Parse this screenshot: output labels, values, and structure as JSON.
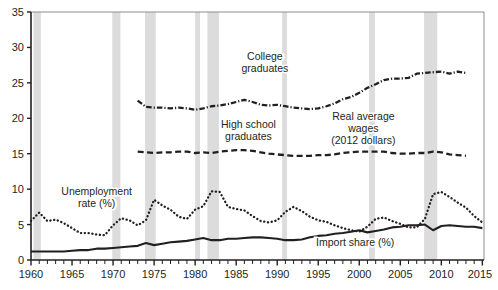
{
  "chart_data": {
    "type": "line",
    "title": "",
    "subtitle": "",
    "xlabel": "",
    "ylabel": "",
    "xlim": [
      1960,
      2015.2
    ],
    "ylim": [
      0,
      35
    ],
    "grid": false,
    "legend_position": "inline-annotations",
    "y_ticks": [
      0,
      5,
      10,
      15,
      20,
      25,
      30,
      35
    ],
    "y_tick_labels": [
      "0",
      "5",
      "10",
      "15",
      "20",
      "25",
      "30",
      "35"
    ],
    "x_ticks": [
      1960,
      1965,
      1970,
      1975,
      1980,
      1985,
      1990,
      1995,
      2000,
      2005,
      2010,
      2015
    ],
    "x_tick_labels": [
      "1960",
      "1965",
      "1970",
      "1975",
      "1980",
      "1985",
      "1990",
      "1995",
      "2000",
      "2005",
      "2010",
      "2015"
    ],
    "x_minor_tick_interval": 1,
    "annotations": [
      {
        "name": "college-graduates-label",
        "text": "College\ngraduates",
        "lines": [
          "College",
          "graduates"
        ],
        "x": 1988.5,
        "y": 28.2
      },
      {
        "name": "high-school-graduates-label",
        "text": "High school\ngraduates",
        "lines": [
          "High school",
          "graduates"
        ],
        "x": 1986.5,
        "y": 18.6
      },
      {
        "name": "real-average-wages-label",
        "text": "Real average\nwages\n(2012 dollars)",
        "lines": [
          "Real average",
          "wages",
          "(2012 dollars)"
        ],
        "x": 2000.5,
        "y": 19.8
      },
      {
        "name": "unemployment-rate-label",
        "text": "Unemployment\nrate (%)",
        "lines": [
          "Unemployment",
          "rate (%)"
        ],
        "x": 1968.0,
        "y": 9.2
      },
      {
        "name": "import-share-label",
        "text": "Import share (%)",
        "lines": [
          "Import share (%)"
        ],
        "x": 1999.5,
        "y": 2.0
      }
    ],
    "recession_bands": [
      {
        "start": 1960.3,
        "end": 1961.2
      },
      {
        "start": 1969.9,
        "end": 1970.9
      },
      {
        "start": 1973.9,
        "end": 1975.2
      },
      {
        "start": 1980.0,
        "end": 1980.6
      },
      {
        "start": 1981.5,
        "end": 1982.9
      },
      {
        "start": 1990.6,
        "end": 1991.2
      },
      {
        "start": 2001.2,
        "end": 2001.9
      },
      {
        "start": 2007.9,
        "end": 2009.5
      }
    ],
    "recession_band_color": "#dcdcdc",
    "series": [
      {
        "name": "College graduates",
        "style": "dash-dot",
        "color": "#231f20",
        "x": [
          1973,
          1974,
          1975,
          1976,
          1977,
          1978,
          1979,
          1980,
          1981,
          1982,
          1983,
          1984,
          1985,
          1986,
          1987,
          1988,
          1989,
          1990,
          1991,
          1992,
          1993,
          1994,
          1995,
          1996,
          1997,
          1998,
          1999,
          2000,
          2001,
          2002,
          2003,
          2004,
          2005,
          2006,
          2007,
          2008,
          2009,
          2010,
          2011,
          2012,
          2013
        ],
        "values": [
          22.5,
          21.6,
          21.5,
          21.5,
          21.4,
          21.5,
          21.4,
          21.2,
          21.4,
          21.7,
          21.8,
          22.0,
          22.3,
          22.6,
          22.3,
          21.9,
          21.8,
          21.9,
          21.7,
          21.5,
          21.4,
          21.3,
          21.4,
          21.7,
          22.1,
          22.7,
          23.0,
          23.6,
          24.3,
          24.8,
          25.4,
          25.6,
          25.6,
          25.7,
          26.3,
          26.4,
          26.5,
          26.6,
          26.3,
          26.6,
          26.4
        ]
      },
      {
        "name": "High school graduates",
        "style": "dashed",
        "color": "#231f20",
        "x": [
          1973,
          1974,
          1975,
          1976,
          1977,
          1978,
          1979,
          1980,
          1981,
          1982,
          1983,
          1984,
          1985,
          1986,
          1987,
          1988,
          1989,
          1990,
          1991,
          1992,
          1993,
          1994,
          1995,
          1996,
          1997,
          1998,
          1999,
          2000,
          2001,
          2002,
          2003,
          2004,
          2005,
          2006,
          2007,
          2008,
          2009,
          2010,
          2011,
          2012,
          2013
        ],
        "values": [
          15.3,
          15.2,
          15.1,
          15.2,
          15.2,
          15.3,
          15.3,
          15.1,
          15.2,
          15.1,
          15.3,
          15.4,
          15.5,
          15.5,
          15.4,
          15.2,
          15.0,
          14.9,
          14.8,
          14.7,
          14.7,
          14.7,
          14.8,
          14.8,
          14.9,
          15.1,
          15.2,
          15.3,
          15.3,
          15.3,
          15.3,
          15.1,
          15.0,
          15.0,
          15.1,
          15.1,
          15.3,
          15.2,
          14.9,
          14.8,
          14.7
        ]
      },
      {
        "name": "Unemployment rate (%)",
        "style": "dotted",
        "color": "#231f20",
        "x": [
          1960,
          1961,
          1962,
          1963,
          1964,
          1965,
          1966,
          1967,
          1968,
          1969,
          1970,
          1971,
          1972,
          1973,
          1974,
          1975,
          1976,
          1977,
          1978,
          1979,
          1980,
          1981,
          1982,
          1983,
          1984,
          1985,
          1986,
          1987,
          1988,
          1989,
          1990,
          1991,
          1992,
          1993,
          1994,
          1995,
          1996,
          1997,
          1998,
          1999,
          2000,
          2001,
          2002,
          2003,
          2004,
          2005,
          2006,
          2007,
          2008,
          2009,
          2010,
          2011,
          2012,
          2013,
          2014,
          2015
        ],
        "values": [
          5.5,
          6.7,
          5.5,
          5.7,
          5.2,
          4.5,
          3.8,
          3.8,
          3.6,
          3.5,
          4.9,
          5.9,
          5.6,
          4.9,
          5.6,
          8.5,
          7.7,
          7.1,
          6.1,
          5.8,
          7.1,
          7.6,
          9.7,
          9.6,
          7.5,
          7.2,
          7.0,
          6.2,
          5.5,
          5.3,
          5.6,
          6.8,
          7.5,
          6.9,
          6.1,
          5.6,
          5.4,
          4.9,
          4.5,
          4.2,
          4.0,
          4.7,
          5.8,
          6.0,
          5.5,
          5.1,
          4.6,
          4.6,
          5.8,
          9.3,
          9.6,
          8.9,
          8.1,
          7.4,
          6.2,
          5.3
        ]
      },
      {
        "name": "Import share (%)",
        "style": "solid",
        "color": "#231f20",
        "x": [
          1960,
          1961,
          1962,
          1963,
          1964,
          1965,
          1966,
          1967,
          1968,
          1969,
          1970,
          1971,
          1972,
          1973,
          1974,
          1975,
          1976,
          1977,
          1978,
          1979,
          1980,
          1981,
          1982,
          1983,
          1984,
          1985,
          1986,
          1987,
          1988,
          1989,
          1990,
          1991,
          1992,
          1993,
          1994,
          1995,
          1996,
          1997,
          1998,
          1999,
          2000,
          2001,
          2002,
          2003,
          2004,
          2005,
          2006,
          2007,
          2008,
          2009,
          2010,
          2011,
          2012,
          2013,
          2014,
          2015
        ],
        "values": [
          1.2,
          1.2,
          1.2,
          1.2,
          1.2,
          1.3,
          1.4,
          1.4,
          1.6,
          1.6,
          1.7,
          1.8,
          1.9,
          2.0,
          2.4,
          2.1,
          2.3,
          2.5,
          2.6,
          2.7,
          2.9,
          3.1,
          2.8,
          2.8,
          3.0,
          3.0,
          3.1,
          3.2,
          3.2,
          3.1,
          3.0,
          2.8,
          2.8,
          2.9,
          3.2,
          3.4,
          3.5,
          3.7,
          3.8,
          4.0,
          4.2,
          3.9,
          4.1,
          4.3,
          4.6,
          4.7,
          4.9,
          4.9,
          5.0,
          4.2,
          4.8,
          4.9,
          4.8,
          4.7,
          4.7,
          4.5
        ]
      }
    ]
  }
}
